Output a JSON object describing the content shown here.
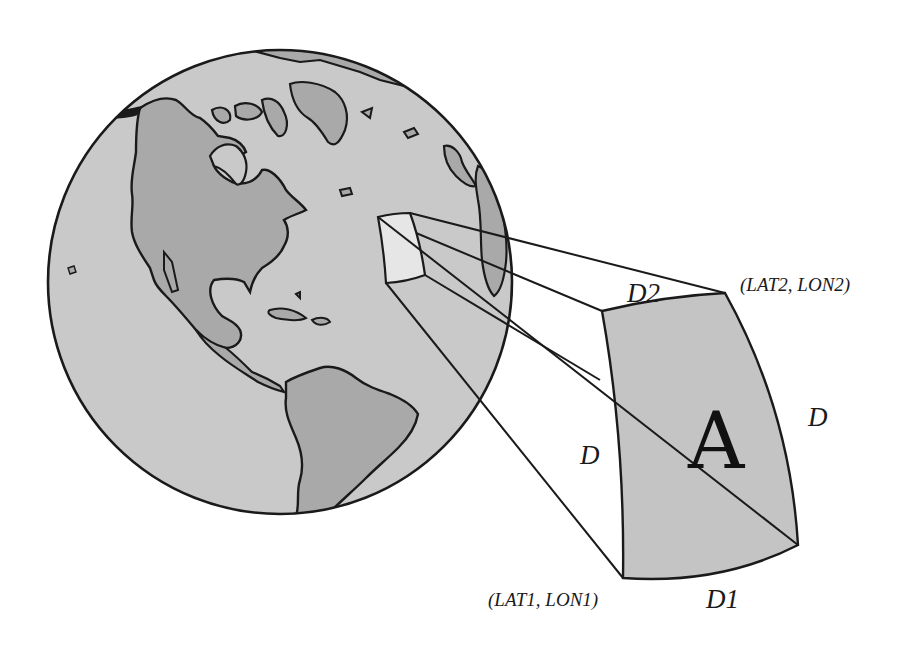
{
  "figure": {
    "type": "diagram",
    "labels": {
      "corner_top_right": "(LAT2, LON2)",
      "corner_bottom_left": "(LAT1, LON1)",
      "top_edge": "D2",
      "bottom_edge": "D1",
      "left_edge": "D",
      "right_edge": "D",
      "area": "A"
    },
    "colors": {
      "ocean": "#c9c9c9",
      "land": "#a9a9a9",
      "patch": "#c4c4c4",
      "patch_on_globe": "#e6e6e6",
      "stroke": "#1a1a1a",
      "background": "#ffffff"
    }
  }
}
